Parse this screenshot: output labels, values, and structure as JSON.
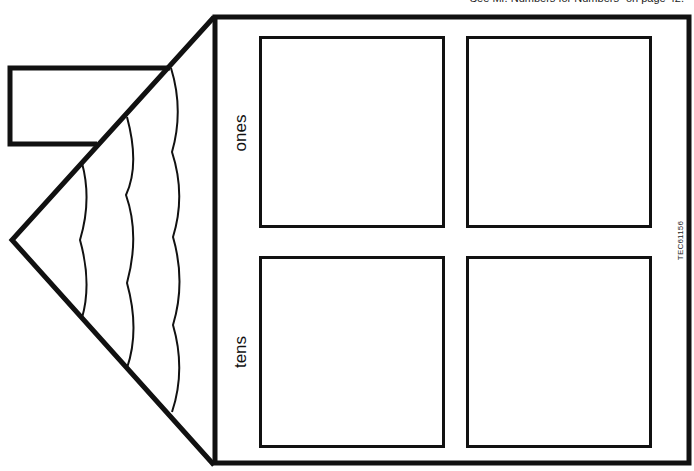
{
  "page": {
    "top_caption": "See Mr. Numbers for Numbers\" on page 42.",
    "product_code": "TEC61156"
  },
  "house": {
    "labels": {
      "ones": "ones",
      "tens": "tens"
    },
    "place_value_boxes": [
      {
        "row": "ones",
        "position": "left"
      },
      {
        "row": "ones",
        "position": "right"
      },
      {
        "row": "tens",
        "position": "left"
      },
      {
        "row": "tens",
        "position": "right"
      }
    ]
  },
  "colors": {
    "line": "#111111",
    "background": "#ffffff"
  }
}
